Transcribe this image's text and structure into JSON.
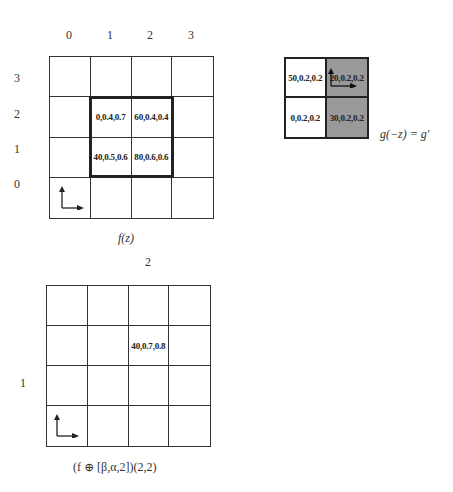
{
  "top_grid": {
    "col_labels": [
      "0",
      "1",
      "2",
      "3"
    ],
    "row_labels": [
      "3",
      "2",
      "1",
      "0"
    ],
    "cells": [
      [
        "",
        "",
        "",
        ""
      ],
      [
        "",
        "0,0.4,0.7",
        "60,0.4,0.4",
        ""
      ],
      [
        "",
        "40,0.5,0.6",
        "80,0.6,0.6",
        ""
      ],
      [
        "",
        "",
        "",
        ""
      ]
    ],
    "caption": "f(z)"
  },
  "kernel_grid": {
    "cells": [
      [
        "50,0.2,0.2",
        "20,0.2,0.2"
      ],
      [
        "0,0.2,0.2",
        "30,0.2,0.2"
      ]
    ],
    "shaded_color": "#999999",
    "caption": "g(−z) = g′"
  },
  "bottom_grid": {
    "col_label": "2",
    "row_label": "1",
    "cells": [
      [
        "",
        "",
        "",
        ""
      ],
      [
        "",
        "",
        "40,0.7,0.8",
        ""
      ],
      [
        "",
        "",
        "",
        ""
      ],
      [
        "",
        "",
        "",
        ""
      ]
    ],
    "caption": "(f ⊕ [β,α,2])(2,2)"
  }
}
